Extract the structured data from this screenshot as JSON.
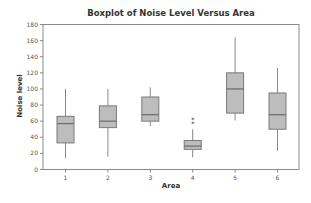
{
  "chart_data": {
    "type": "boxplot",
    "title": "Boxplot of Noise Level Versus Area",
    "xlabel": "Area",
    "ylabel": "Noise level",
    "categories": [
      "1",
      "2",
      "3",
      "4",
      "5",
      "6"
    ],
    "ylim": [
      0,
      180
    ],
    "yticks": [
      0,
      20,
      40,
      60,
      80,
      100,
      120,
      140,
      160,
      180
    ],
    "grid": false,
    "legend": null,
    "boxes": [
      {
        "category": "1",
        "whisker_low": 14,
        "q1": 33,
        "median": 57,
        "q3": 66,
        "whisker_high": 100,
        "outliers": []
      },
      {
        "category": "2",
        "whisker_low": 16,
        "q1": 52,
        "median": 60,
        "q3": 79,
        "whisker_high": 100,
        "outliers": []
      },
      {
        "category": "3",
        "whisker_low": 54,
        "q1": 60,
        "median": 68,
        "q3": 90,
        "whisker_high": 102,
        "outliers": []
      },
      {
        "category": "4",
        "whisker_low": 15,
        "q1": 25,
        "median": 29,
        "q3": 36,
        "whisker_high": 50,
        "outliers": [
          57,
          62
        ]
      },
      {
        "category": "5",
        "whisker_low": 61,
        "q1": 70,
        "median": 100,
        "q3": 120,
        "whisker_high": 164,
        "outliers": []
      },
      {
        "category": "6",
        "whisker_low": 23,
        "q1": 50,
        "median": 68,
        "q3": 95,
        "whisker_high": 126,
        "outliers": []
      }
    ],
    "colors": {
      "box_fill": "#bdbdbd",
      "box_stroke": "#7a7a7a",
      "frame": "#8a8a8a"
    }
  }
}
